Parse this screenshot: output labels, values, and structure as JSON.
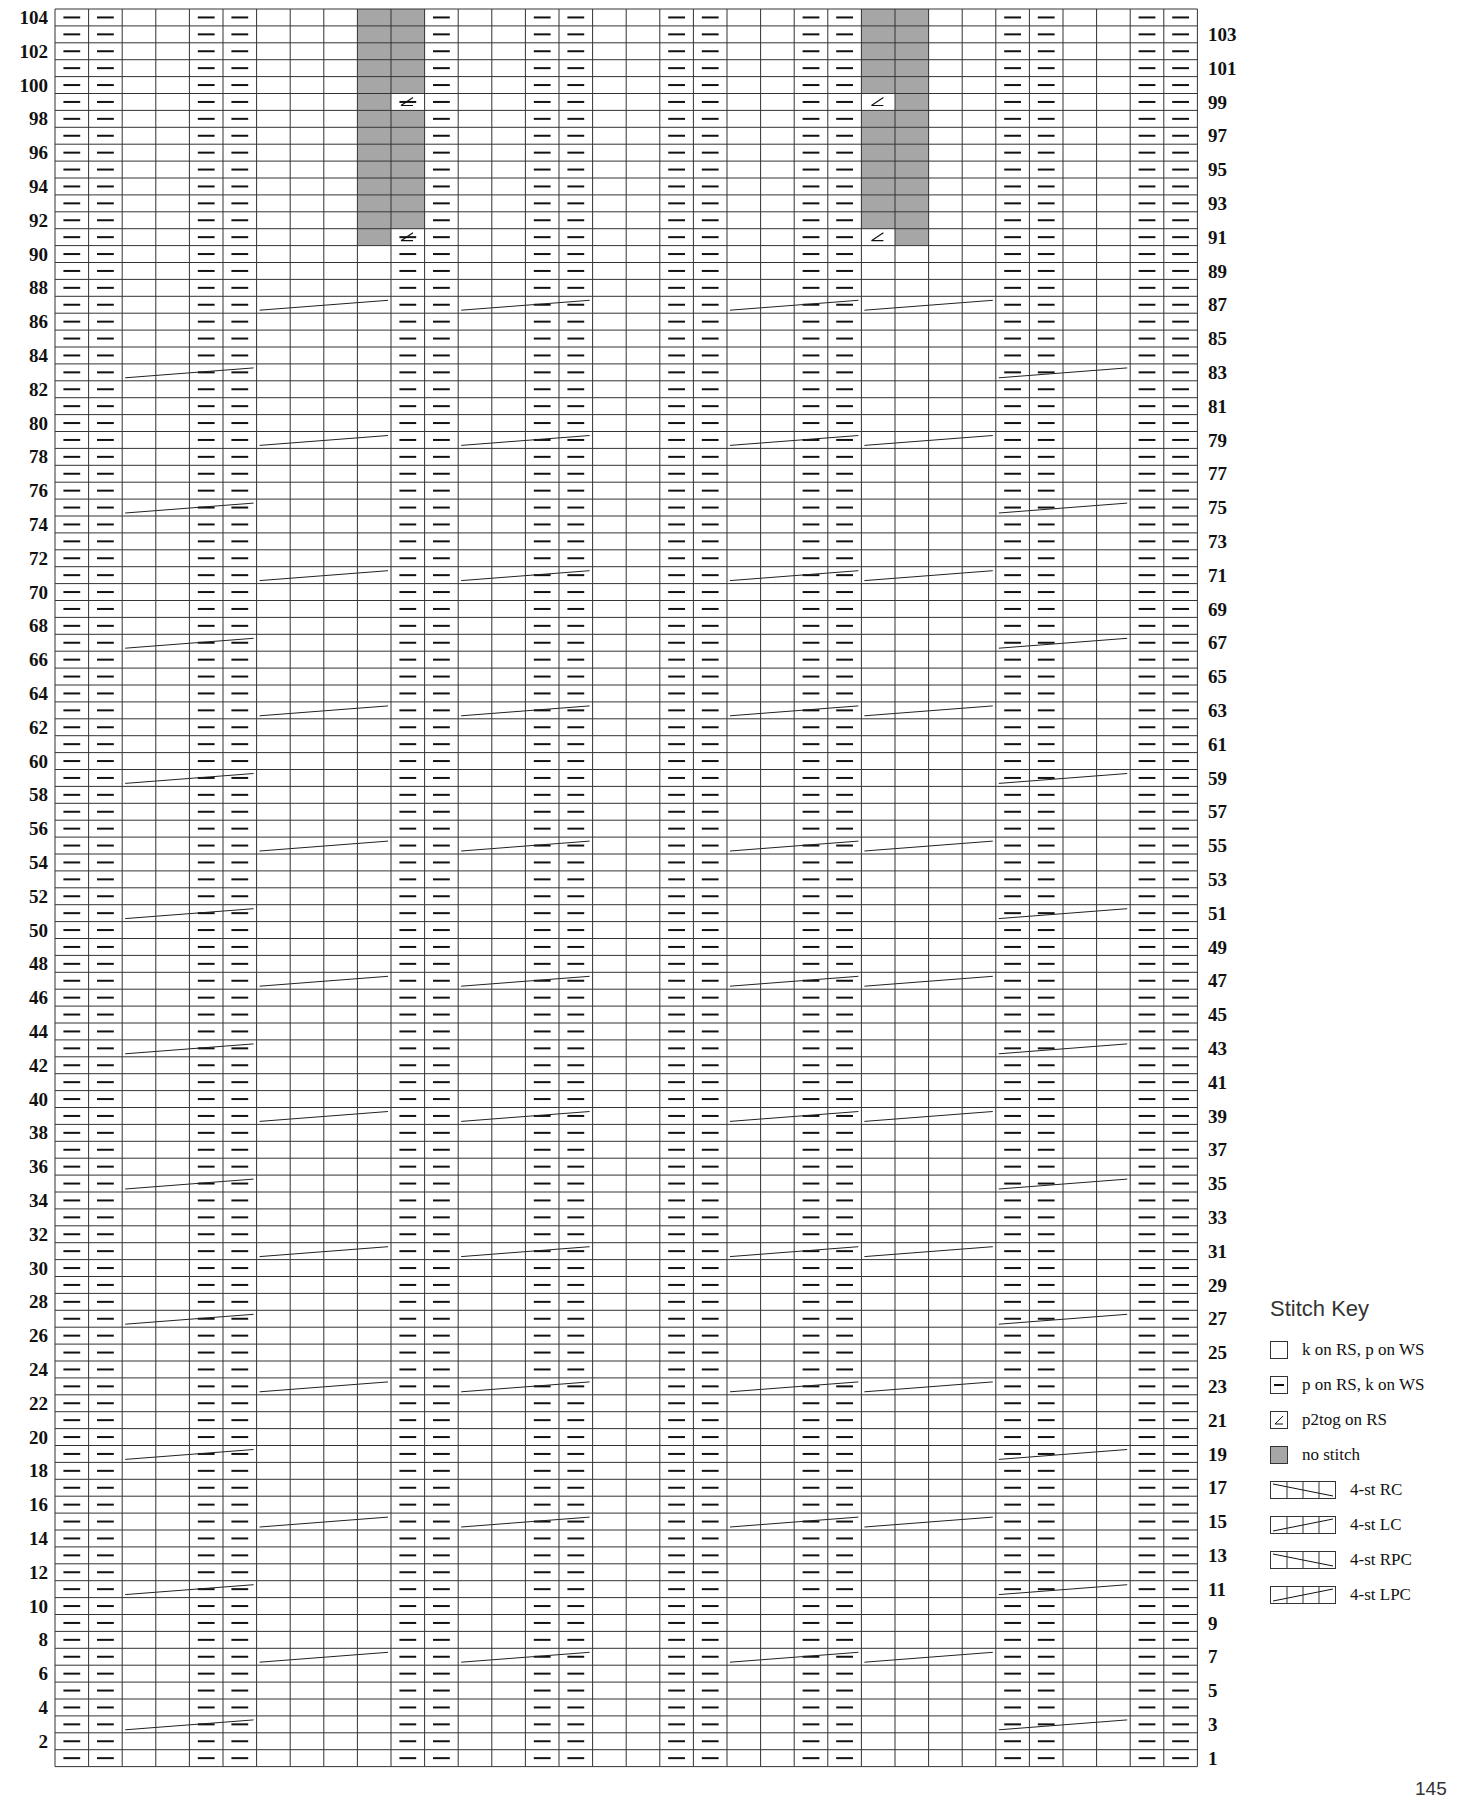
{
  "chart": {
    "rows": 104,
    "cols": 34,
    "cell_width": 33.6,
    "cell_height": 16.9,
    "grid_color": "#333333",
    "no_stitch_color": "#a6a6a6",
    "left_labels_even": true,
    "right_labels_odd": true,
    "purl_columns_base": [
      0,
      1,
      4,
      5,
      10,
      11,
      14,
      15,
      18,
      19,
      22,
      23,
      28,
      29,
      32,
      33
    ],
    "no_stitch_zone": {
      "from_row": 91,
      "to_row": 104,
      "cols": [
        9,
        10,
        24,
        25
      ]
    },
    "p2tog_cells": [
      {
        "row": 91,
        "col": 10
      },
      {
        "row": 91,
        "col": 24
      },
      {
        "row": 99,
        "col": 10
      },
      {
        "row": 99,
        "col": 24
      }
    ]
  },
  "key": {
    "title": "Stitch Key",
    "items": [
      {
        "symbol": "blank",
        "label": "k on RS, p on WS"
      },
      {
        "symbol": "dash",
        "label": "p on RS, k on WS"
      },
      {
        "symbol": "p2tog",
        "label": "p2tog on RS"
      },
      {
        "symbol": "gray",
        "label": "no stitch"
      },
      {
        "symbol": "cable-rc",
        "label": "4-st RC"
      },
      {
        "symbol": "cable-lc",
        "label": "4-st LC"
      },
      {
        "symbol": "cable-rpc",
        "label": "4-st RPC"
      },
      {
        "symbol": "cable-lpc",
        "label": "4-st LPC"
      }
    ]
  },
  "page_number": "145"
}
